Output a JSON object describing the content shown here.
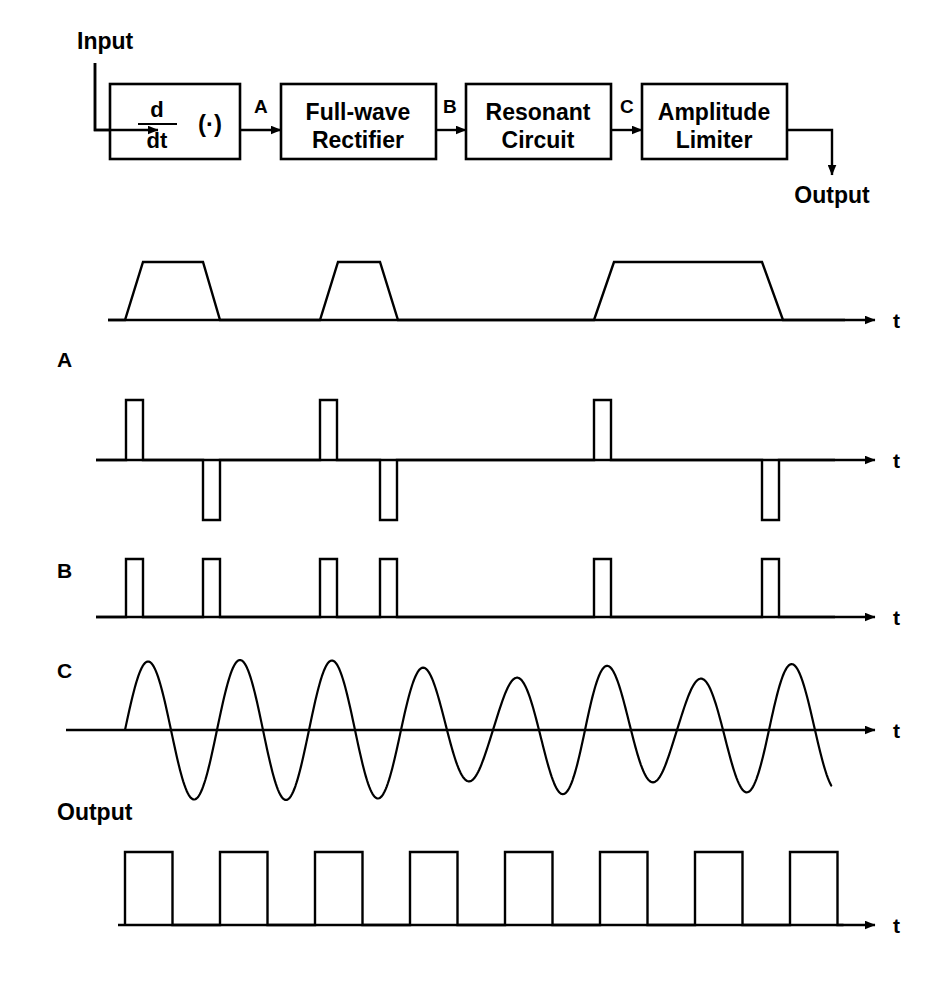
{
  "figure": {
    "stroke_color": "#000000",
    "background_color": "#ffffff"
  },
  "block_diagram": {
    "input_label": "Input",
    "output_label": "Output",
    "blocks": [
      {
        "id": "differentiator",
        "numerator": "d",
        "denominator": "dt",
        "operand": "(·)",
        "x": 110,
        "y": 84,
        "w": 130,
        "h": 75
      },
      {
        "id": "rectifier",
        "line1": "Full-wave",
        "line2": "Rectifier",
        "x": 281,
        "y": 84,
        "w": 155,
        "h": 75
      },
      {
        "id": "resonant",
        "line1": "Resonant",
        "line2": "Circuit",
        "x": 466,
        "y": 84,
        "w": 145,
        "h": 75
      },
      {
        "id": "limiter",
        "line1": "Amplitude",
        "line2": "Limiter",
        "x": 642,
        "y": 84,
        "w": 145,
        "h": 75
      }
    ],
    "tap_labels": [
      {
        "label": "A",
        "x": 254,
        "y": 113
      },
      {
        "label": "B",
        "x": 443,
        "y": 113
      },
      {
        "label": "C",
        "x": 620,
        "y": 113
      }
    ]
  },
  "waveforms": [
    {
      "id": "input",
      "label": "",
      "axis_label": "t",
      "baseline_y": 320,
      "axis_x0": 108,
      "axis_x1": 875,
      "description": "Trapezoidal input pulses of differing widths",
      "kind": "trapezoid-train",
      "amplitude": 58,
      "pulses": [
        {
          "rise_start": 125,
          "rise_end": 143,
          "fall_start": 203,
          "fall_end": 220
        },
        {
          "rise_start": 320,
          "rise_end": 338,
          "fall_start": 380,
          "fall_end": 398
        },
        {
          "rise_start": 594,
          "rise_end": 614,
          "fall_start": 762,
          "fall_end": 783
        }
      ]
    },
    {
      "id": "A",
      "label": "A",
      "axis_label": "t",
      "baseline_y": 460,
      "axis_x0": 96,
      "axis_x1": 875,
      "description": "Bipolar differentiated pulses: positive spike at each rising edge, negative spike at each falling edge",
      "kind": "bipolar-pulse-train",
      "pos_amplitude": 60,
      "neg_amplitude": 60,
      "pulse_width": 17,
      "positive_edges": [
        126,
        320,
        594
      ],
      "negative_edges": [
        203,
        380,
        762
      ]
    },
    {
      "id": "B",
      "label": "B",
      "axis_label": "t",
      "baseline_y": 617,
      "axis_x0": 96,
      "axis_x1": 875,
      "description": "Full-wave rectified pulses: all six edges become positive pulses",
      "kind": "pulse-train",
      "amplitude": 58,
      "pulse_width": 17,
      "pulse_starts": [
        126,
        203,
        320,
        380,
        594,
        762
      ]
    },
    {
      "id": "C",
      "label": "C",
      "axis_label": "t",
      "baseline_y": 730,
      "axis_x0": 66,
      "axis_x1": 875,
      "description": "Ringing output of the resonant circuit; amplitude decays between excitations and is re-excited at each input pulse",
      "kind": "damped-oscillation",
      "start_x": 125,
      "end_x": 832,
      "period": 92,
      "base_amplitude": 68,
      "envelope": [
        {
          "x": 125,
          "amp": 68
        },
        {
          "x": 217,
          "amp": 70
        },
        {
          "x": 310,
          "amp": 70
        },
        {
          "x": 400,
          "amp": 68
        },
        {
          "x": 492,
          "amp": 46
        },
        {
          "x": 585,
          "amp": 70
        },
        {
          "x": 678,
          "amp": 46
        },
        {
          "x": 770,
          "amp": 68
        },
        {
          "x": 832,
          "amp": 62
        }
      ]
    },
    {
      "id": "output",
      "label": "Output",
      "axis_label": "t",
      "baseline_y": 925,
      "axis_x0": 118,
      "axis_x1": 875,
      "description": "Amplitude-limited square wave at the resonant frequency",
      "kind": "square-wave",
      "amplitude": 73,
      "start_x": 125,
      "period": 95,
      "duty": 0.5,
      "cycles": 8
    }
  ]
}
